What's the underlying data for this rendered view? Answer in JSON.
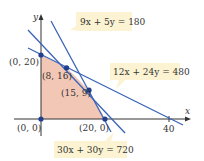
{
  "diagram": {
    "type": "linear-programming-feasible-region",
    "axes": {
      "x_label": "x",
      "y_label": "y",
      "x_tick_label": "40"
    },
    "constraints": [
      {
        "id": "c1",
        "label": "9x + 5y = 180"
      },
      {
        "id": "c2",
        "label": "12x + 24y = 480"
      },
      {
        "id": "c3",
        "label": "30x + 30y = 720"
      }
    ],
    "vertices": [
      {
        "label": "(0, 20)"
      },
      {
        "label": "(8, 16)"
      },
      {
        "label": "(15, 9)"
      },
      {
        "label": "(20, 0)"
      },
      {
        "label": "(0, 0)"
      }
    ],
    "colors": {
      "line": "#3a64b8",
      "region_fill": "#f3c7b6",
      "callout_fill": "#fbf3d2",
      "axis": "#333333",
      "vertex": "#1f3f8f"
    }
  }
}
